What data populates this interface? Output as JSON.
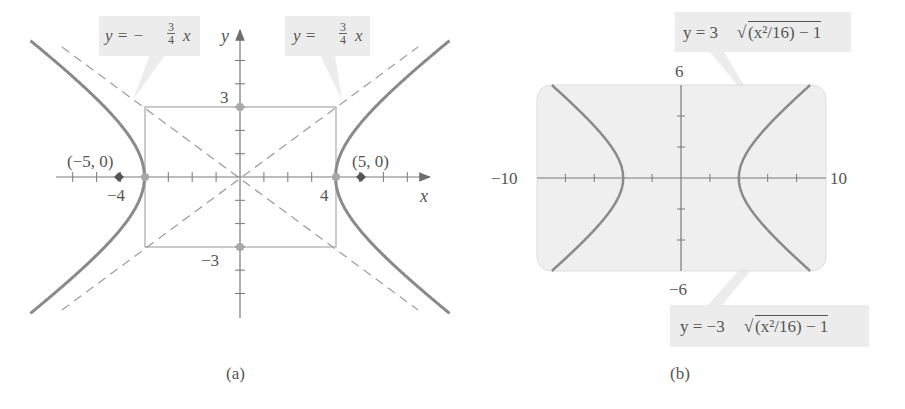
{
  "figure": {
    "panel_a": {
      "caption": "(a)",
      "x_axis_label": "x",
      "y_axis_label": "y",
      "tick_labels": {
        "x_neg": "−4",
        "x_pos": "4",
        "y_pos": "3",
        "y_neg": "−3"
      },
      "foci_labels": {
        "left": "(−5, 0)",
        "right": "(5, 0)"
      },
      "asymptote_left": {
        "lhs": "y = −",
        "num": "3",
        "den": "4",
        "var": "x"
      },
      "asymptote_right": {
        "lhs": "y = ",
        "num": "3",
        "den": "4",
        "var": "x"
      }
    },
    "panel_b": {
      "caption": "(b)",
      "xmin_label": "−10",
      "xmax_label": "10",
      "ymax_label": "6",
      "ymin_label": "−6",
      "upper_eq": {
        "lhs": "y = 3",
        "radicand": "(x²/16) − 1"
      },
      "lower_eq": {
        "lhs": "y = −3",
        "radicand": "(x²/16) − 1"
      }
    },
    "colors": {
      "curve": "#8a8a8a",
      "axis": "#7a7a7a",
      "box": "#a8a8a8",
      "asymptote": "#a0a0a0",
      "label_bg": "#ececec",
      "screen_bg": "#efefef",
      "focus": "#555555"
    }
  },
  "chart_data": [
    {
      "type": "line",
      "title": "(a) Hyperbola x²/16 − y²/9 = 1 with asymptotes",
      "xlabel": "x",
      "ylabel": "y",
      "xlim": [
        -7.5,
        7.5
      ],
      "ylim": [
        -6,
        6
      ],
      "series": [
        {
          "name": "hyperbola right branch",
          "equation": "x²/16 − y²/9 = 1",
          "vertex": [
            4,
            0
          ]
        },
        {
          "name": "hyperbola left branch",
          "equation": "x²/16 − y²/9 = 1",
          "vertex": [
            -4,
            0
          ]
        },
        {
          "name": "asymptote y = 3/4 x",
          "style": "dashed",
          "slope": 0.75
        },
        {
          "name": "asymptote y = −3/4 x",
          "style": "dashed",
          "slope": -0.75
        }
      ],
      "central_box": {
        "x": [
          -4,
          4
        ],
        "y": [
          -3,
          3
        ]
      },
      "points": [
        {
          "label": "(−5, 0)",
          "x": -5,
          "y": 0,
          "kind": "focus"
        },
        {
          "label": "(5, 0)",
          "x": 5,
          "y": 0,
          "kind": "focus"
        },
        {
          "x": -4,
          "y": 0,
          "kind": "vertex"
        },
        {
          "x": 4,
          "y": 0,
          "kind": "vertex"
        },
        {
          "x": 0,
          "y": 3,
          "kind": "co-vertex"
        },
        {
          "x": 0,
          "y": -3,
          "kind": "co-vertex"
        }
      ],
      "tick_labels": {
        "x": [
          "−4",
          "4"
        ],
        "y": [
          "3",
          "−3"
        ]
      },
      "annotations": [
        "y = −3/4 x",
        "y = 3/4 x"
      ],
      "grid": false
    },
    {
      "type": "line",
      "title": "(b) Graphing calculator view",
      "xlim": [
        -10,
        10
      ],
      "ylim": [
        -6,
        6
      ],
      "x_tick_step": 2,
      "y_tick_step": 2,
      "series": [
        {
          "name": "upper",
          "equation": "y = 3√((x²/16) − 1)"
        },
        {
          "name": "lower",
          "equation": "y = −3√((x²/16) − 1)"
        }
      ],
      "tick_labels": {
        "xmin": "−10",
        "xmax": "10",
        "ymax": "6",
        "ymin": "−6"
      },
      "grid": false
    }
  ]
}
